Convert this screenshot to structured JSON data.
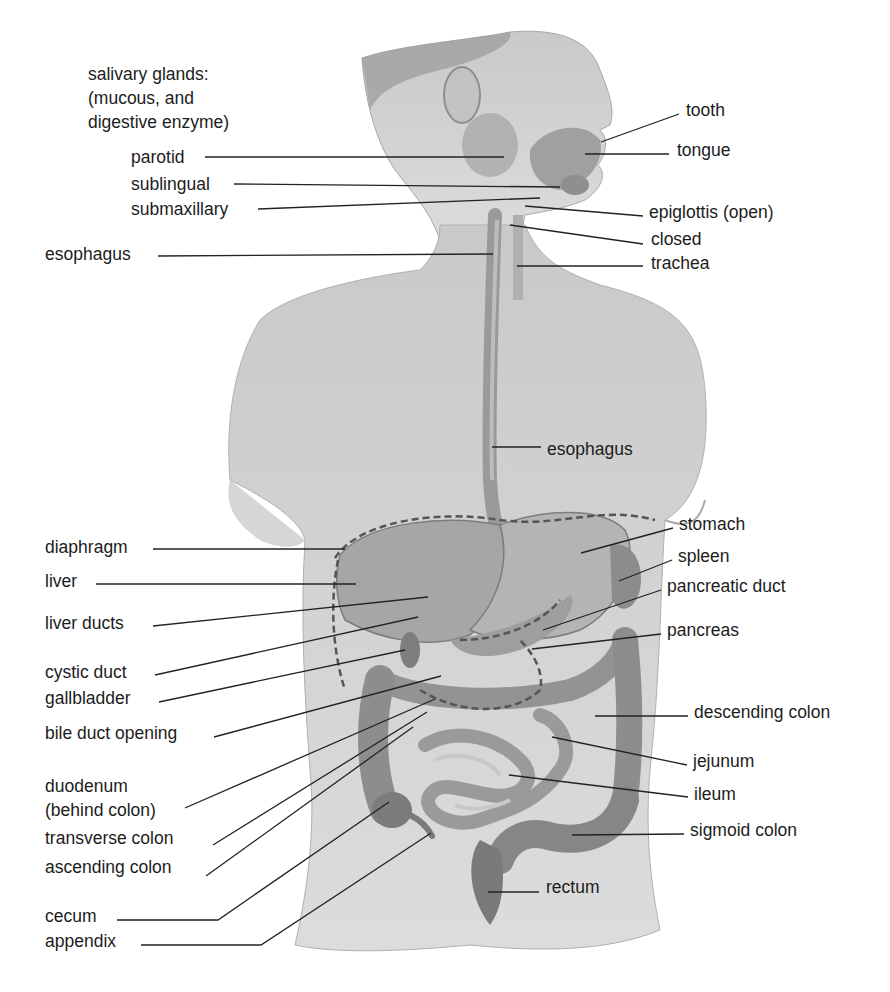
{
  "diagram": {
    "title_block": {
      "lines": [
        "salivary glands:",
        "(mucous, and",
        "digestive enzyme)"
      ],
      "x": 88,
      "y": 62
    },
    "colors": {
      "background": "#ffffff",
      "skin": "#d2d2d2",
      "skin_dark": "#b4b4b4",
      "organ": "#9c9c9c",
      "organ_dark": "#7a7a7a",
      "text": "#1c1c1c",
      "leader": "#222222",
      "dashed": "#555555"
    },
    "labels": [
      {
        "id": "tooth",
        "text": "tooth",
        "x": 686,
        "y": 98,
        "line": [
          679,
          114,
          601,
          142
        ]
      },
      {
        "id": "tongue",
        "text": "tongue",
        "x": 677,
        "y": 138,
        "line": [
          669,
          154,
          585,
          154
        ]
      },
      {
        "id": "parotid",
        "text": "parotid",
        "x": 131,
        "y": 145,
        "line": [
          205,
          157,
          504,
          157
        ]
      },
      {
        "id": "sublingual",
        "text": "sublingual",
        "x": 131,
        "y": 172,
        "line": [
          234,
          184,
          560,
          187
        ]
      },
      {
        "id": "submaxillary",
        "text": "submaxillary",
        "x": 131,
        "y": 197,
        "line": [
          258,
          209,
          540,
          198
        ]
      },
      {
        "id": "epiglottis-open",
        "text": "epiglottis (open)",
        "x": 649,
        "y": 200,
        "line": [
          643,
          216,
          525,
          206
        ]
      },
      {
        "id": "closed",
        "text": "closed",
        "x": 651,
        "y": 227,
        "line": [
          643,
          244,
          510,
          225
        ]
      },
      {
        "id": "esophagus-upper",
        "text": "esophagus",
        "x": 45,
        "y": 242,
        "line": [
          158,
          256,
          493,
          254
        ]
      },
      {
        "id": "trachea",
        "text": "trachea",
        "x": 651,
        "y": 251,
        "line": [
          643,
          266,
          517,
          266
        ]
      },
      {
        "id": "esophagus-lower",
        "text": "esophagus",
        "x": 547,
        "y": 437,
        "line": [
          541,
          447,
          492,
          447
        ]
      },
      {
        "id": "stomach",
        "text": "stomach",
        "x": 679,
        "y": 512,
        "line": [
          673,
          528,
          581,
          553
        ]
      },
      {
        "id": "diaphragm",
        "text": "diaphragm",
        "x": 45,
        "y": 535,
        "line": [
          153,
          549,
          345,
          549
        ]
      },
      {
        "id": "spleen",
        "text": "spleen",
        "x": 678,
        "y": 544,
        "line": [
          672,
          560,
          619,
          581
        ]
      },
      {
        "id": "liver",
        "text": "liver",
        "x": 45,
        "y": 569,
        "line": [
          96,
          584,
          356,
          584
        ]
      },
      {
        "id": "pancreatic-duct",
        "text": "pancreatic duct",
        "x": 667,
        "y": 574,
        "line": [
          661,
          590,
          543,
          630
        ]
      },
      {
        "id": "liver-ducts",
        "text": "liver ducts",
        "x": 45,
        "y": 611,
        "line": [
          153,
          626,
          428,
          597
        ]
      },
      {
        "id": "pancreas",
        "text": "pancreas",
        "x": 667,
        "y": 618,
        "line": [
          661,
          634,
          532,
          649
        ]
      },
      {
        "id": "cystic-duct",
        "text": "cystic duct",
        "x": 45,
        "y": 660,
        "line": [
          155,
          675,
          418,
          617
        ]
      },
      {
        "id": "gallbladder",
        "text": "gallbladder",
        "x": 45,
        "y": 686,
        "line": [
          159,
          702,
          405,
          650
        ]
      },
      {
        "id": "bile-duct-opening",
        "text": "bile duct opening",
        "x": 45,
        "y": 721,
        "line": [
          214,
          737,
          441,
          676
        ]
      },
      {
        "id": "descending-colon",
        "text": "descending colon",
        "x": 694,
        "y": 700,
        "line": [
          688,
          716,
          595,
          716
        ]
      },
      {
        "id": "jejunum",
        "text": "jejunum",
        "x": 693,
        "y": 749,
        "line": [
          687,
          765,
          552,
          737
        ]
      },
      {
        "id": "duodenum",
        "text": "duodenum\n(behind colon)",
        "x": 45,
        "y": 774,
        "line": [
          185,
          808,
          435,
          699
        ]
      },
      {
        "id": "ileum",
        "text": "ileum",
        "x": 694,
        "y": 782,
        "line": [
          688,
          797,
          509,
          775
        ]
      },
      {
        "id": "transverse-colon",
        "text": "transverse colon",
        "x": 45,
        "y": 826,
        "line": [
          213,
          845,
          427,
          712
        ]
      },
      {
        "id": "sigmoid-colon",
        "text": "sigmoid colon",
        "x": 690,
        "y": 818,
        "line": [
          684,
          834,
          572,
          835
        ]
      },
      {
        "id": "ascending-colon",
        "text": "ascending colon",
        "x": 45,
        "y": 855,
        "line": [
          206,
          876,
          413,
          727
        ]
      },
      {
        "id": "rectum",
        "text": "rectum",
        "x": 546,
        "y": 875,
        "line": [
          539,
          892,
          488,
          892
        ]
      },
      {
        "id": "cecum",
        "text": "cecum",
        "x": 45,
        "y": 904,
        "line": [
          117,
          920,
          218,
          920,
          389,
          802
        ]
      },
      {
        "id": "appendix",
        "text": "appendix",
        "x": 45,
        "y": 929,
        "line": [
          141,
          945,
          261,
          945,
          431,
          833
        ]
      }
    ],
    "dashed_outlines": [
      {
        "id": "diaphragm-outline",
        "path": "M335 558 C 360 520, 440 510, 500 520 C 560 528, 600 505, 655 520"
      },
      {
        "id": "liver-outline",
        "path": "M338 560 C 330 600, 332 650, 345 690"
      },
      {
        "id": "pancreatic-duct-outline",
        "path": "M460 640 C 500 640, 540 625, 560 600"
      },
      {
        "id": "duodenum-outline",
        "path": "M420 690 C 470 720, 520 710, 540 690 C 545 670, 530 650, 520 640"
      }
    ]
  }
}
